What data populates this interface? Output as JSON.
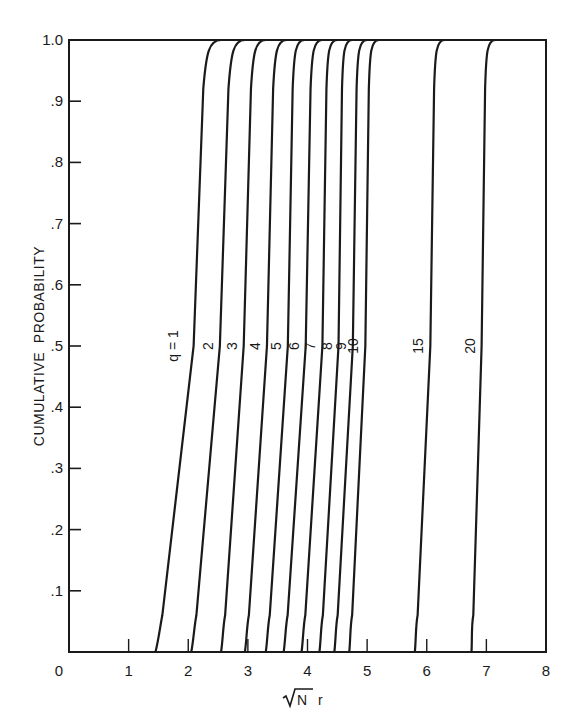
{
  "chart_data": {
    "type": "line",
    "title": "",
    "xlabel": "√N r",
    "ylabel": "CUMULATIVE PROBABILITY",
    "xlim": [
      0,
      8
    ],
    "ylim": [
      0,
      1.0
    ],
    "grid": false,
    "legend": "inline curve labels",
    "x_ticks": [
      0,
      1,
      2,
      3,
      4,
      5,
      6,
      7,
      8
    ],
    "x_tick_labels": [
      "0",
      "1",
      "2",
      "3",
      "4",
      "5",
      "6",
      "7",
      "8"
    ],
    "y_ticks": [
      0.1,
      0.2,
      0.3,
      0.4,
      0.5,
      0.6,
      0.7,
      0.8,
      0.9,
      1.0
    ],
    "y_tick_labels": [
      ".1",
      ".2",
      ".3",
      ".4",
      ".5",
      ".6",
      ".7",
      ".8",
      ".9",
      "1.0"
    ],
    "series": [
      {
        "name": "q = 1",
        "label": "q = 1",
        "start": 1.45,
        "median": 2.09,
        "end": 2.45
      },
      {
        "name": "q = 2",
        "label": "2",
        "start": 2.05,
        "median": 2.53,
        "end": 2.85
      },
      {
        "name": "q = 3",
        "label": "3",
        "start": 2.55,
        "median": 2.93,
        "end": 3.2
      },
      {
        "name": "q = 4",
        "label": "4",
        "start": 2.95,
        "median": 3.32,
        "end": 3.55
      },
      {
        "name": "q = 5",
        "label": "5",
        "start": 3.3,
        "median": 3.67,
        "end": 3.85
      },
      {
        "name": "q = 6",
        "label": "6",
        "start": 3.6,
        "median": 3.97,
        "end": 4.15
      },
      {
        "name": "q = 7",
        "label": "7",
        "start": 3.9,
        "median": 4.25,
        "end": 4.4
      },
      {
        "name": "q = 8",
        "label": "8",
        "start": 4.2,
        "median": 4.52,
        "end": 4.65
      },
      {
        "name": "q = 9",
        "label": "9",
        "start": 4.45,
        "median": 4.76,
        "end": 4.9
      },
      {
        "name": "q = 10",
        "label": "10",
        "start": 4.7,
        "median": 4.97,
        "end": 5.1
      },
      {
        "name": "q = 15",
        "label": "15",
        "start": 5.8,
        "median": 6.06,
        "end": 6.2
      },
      {
        "name": "q = 20",
        "label": "20",
        "start": 6.75,
        "median": 6.92,
        "end": 7.05
      }
    ]
  },
  "labels": {
    "x_axis_title_root": "√",
    "x_axis_title_N": "N",
    "x_axis_title_r": "r",
    "y_axis_title": "CUMULATIVE  PROBABILITY"
  }
}
